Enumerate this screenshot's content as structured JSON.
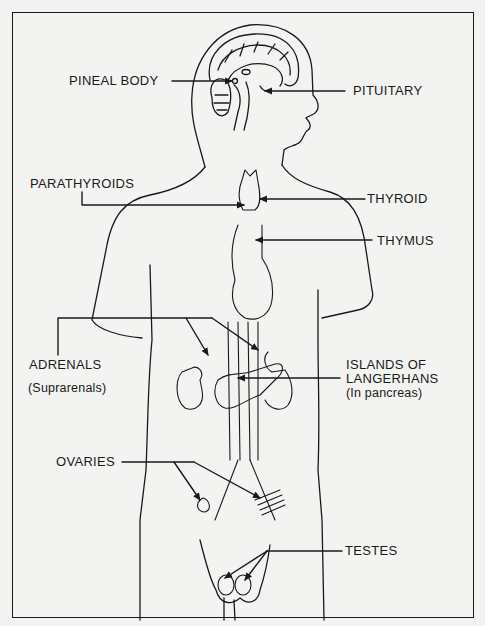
{
  "diagram": {
    "style": {
      "line_color": "#1a1a1a",
      "background": "#f3f3f1"
    },
    "labels": {
      "pineal_body": "PINEAL BODY",
      "pituitary": "PITUITARY",
      "parathyroids": "PARATHYROIDS",
      "thyroid": "THYROID",
      "thymus": "THYMUS",
      "adrenals": "ADRENALS",
      "adrenals_sub": "(Suprarenals)",
      "islands_line1": "ISLANDS OF",
      "islands_line2": "LANGERHANS",
      "islands_sub": "(In pancreas)",
      "ovaries": "OVARIES",
      "testes": "TESTES"
    }
  }
}
